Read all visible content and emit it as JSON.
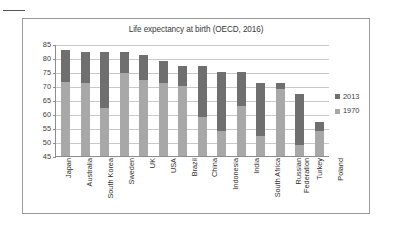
{
  "chart_data": {
    "type": "bar",
    "title": "Life expectancy at birth (OECD, 2016)",
    "xlabel": "",
    "ylabel": "",
    "ylim": [
      45,
      85
    ],
    "ytick_step": 5,
    "yticks": [
      85,
      80,
      75,
      70,
      65,
      60,
      55,
      50,
      45
    ],
    "grid": true,
    "stacked": true,
    "legend_position": "right",
    "categories": [
      "Japan",
      "Australia",
      "South Korea",
      "Sweden",
      "UK",
      "USA",
      "Brazil",
      "China",
      "Indonesia",
      "India",
      "South Africa",
      "Russian Federation",
      "Turkey",
      "Poland"
    ],
    "series": [
      {
        "name": "1970",
        "color": "#a8a8a8",
        "values": [
          71.5,
          71,
          62,
          74.5,
          72,
          71,
          70,
          59,
          54,
          63,
          52,
          69,
          49,
          54
        ]
      },
      {
        "name": "2013",
        "color": "#6f6f6f",
        "values": [
          83,
          82,
          82,
          82,
          81,
          79,
          77,
          77,
          75,
          75,
          71,
          71,
          67,
          57
        ]
      }
    ]
  },
  "legend": {
    "items": [
      {
        "label": "2013",
        "color": "#6f6f6f"
      },
      {
        "label": "1970",
        "color": "#a8a8a8"
      }
    ]
  }
}
